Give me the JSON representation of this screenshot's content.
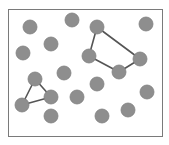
{
  "canvas": {
    "width": 169,
    "height": 145,
    "background": "#ffffff"
  },
  "frame": {
    "x": 8,
    "y": 9,
    "width": 154,
    "height": 127,
    "stroke": "#7a7a7a",
    "stroke_width": 1
  },
  "style": {
    "node_fill": "#8e8e8e",
    "node_stroke": "#808080",
    "node_radius": 7,
    "edge_stroke": "#555555",
    "edge_width": 1.6
  },
  "nodes": [
    {
      "id": "n1",
      "x": 30,
      "y": 27
    },
    {
      "id": "n2",
      "x": 72,
      "y": 20
    },
    {
      "id": "n3",
      "x": 97,
      "y": 27
    },
    {
      "id": "n4",
      "x": 146,
      "y": 24
    },
    {
      "id": "n5",
      "x": 51,
      "y": 44
    },
    {
      "id": "n6",
      "x": 23,
      "y": 53
    },
    {
      "id": "n7",
      "x": 89,
      "y": 56
    },
    {
      "id": "n8",
      "x": 140,
      "y": 59
    },
    {
      "id": "n9",
      "x": 119,
      "y": 72
    },
    {
      "id": "n10",
      "x": 64,
      "y": 73
    },
    {
      "id": "n11",
      "x": 35,
      "y": 79
    },
    {
      "id": "n12",
      "x": 97,
      "y": 84
    },
    {
      "id": "n13",
      "x": 147,
      "y": 92
    },
    {
      "id": "n14",
      "x": 51,
      "y": 97
    },
    {
      "id": "n15",
      "x": 77,
      "y": 97
    },
    {
      "id": "n16",
      "x": 22,
      "y": 105
    },
    {
      "id": "n17",
      "x": 128,
      "y": 110
    },
    {
      "id": "n18",
      "x": 51,
      "y": 116
    },
    {
      "id": "n19",
      "x": 102,
      "y": 116
    }
  ],
  "groups": [
    {
      "name": "quadrilateral-cluster",
      "closed": true,
      "nodes": [
        "n3",
        "n8",
        "n9",
        "n7"
      ]
    },
    {
      "name": "triangle-cluster",
      "closed": true,
      "nodes": [
        "n11",
        "n14",
        "n16"
      ]
    }
  ]
}
